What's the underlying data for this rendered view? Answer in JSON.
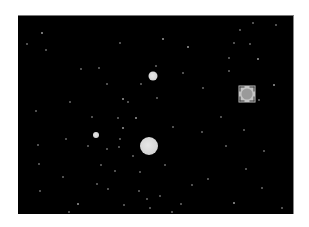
{
  "view": {
    "background": "#000000",
    "page_background": "#ffffff",
    "origin": [
      18,
      15
    ],
    "size": [
      276,
      199
    ]
  },
  "bodies": [
    {
      "name": "large-star",
      "x": 149,
      "y": 145,
      "r": 9
    },
    {
      "name": "medium-star",
      "x": 153,
      "y": 75,
      "r": 4.5
    },
    {
      "name": "small-star",
      "x": 96,
      "y": 134,
      "r": 3
    }
  ],
  "selection": {
    "label": "selected-object",
    "x": 247,
    "y": 93,
    "size": 17,
    "color": "#c4c4c4"
  },
  "stars": [
    [
      42,
      32,
      "dim"
    ],
    [
      27,
      43,
      "faint"
    ],
    [
      46,
      49,
      "faint"
    ],
    [
      120,
      42,
      "faint"
    ],
    [
      163,
      38,
      "dim"
    ],
    [
      188,
      46,
      "dim"
    ],
    [
      240,
      29,
      "faint"
    ],
    [
      253,
      22,
      "faint"
    ],
    [
      276,
      24,
      "faint"
    ],
    [
      250,
      43,
      "faint"
    ],
    [
      234,
      42,
      "faint"
    ],
    [
      229,
      57,
      "faint"
    ],
    [
      258,
      58,
      "dim"
    ],
    [
      81,
      68,
      "faint"
    ],
    [
      99,
      67,
      "faint"
    ],
    [
      156,
      65,
      "faint"
    ],
    [
      183,
      72,
      "faint"
    ],
    [
      203,
      87,
      "faint"
    ],
    [
      229,
      70,
      "faint"
    ],
    [
      274,
      84,
      "dim"
    ],
    [
      259,
      99,
      "faint"
    ],
    [
      107,
      83,
      "faint"
    ],
    [
      141,
      83,
      "faint"
    ],
    [
      123,
      98,
      "dim"
    ],
    [
      128,
      101,
      "faint"
    ],
    [
      70,
      101,
      "faint"
    ],
    [
      36,
      110,
      "faint"
    ],
    [
      157,
      97,
      "faint"
    ],
    [
      92,
      116,
      "faint"
    ],
    [
      136,
      117,
      "dim"
    ],
    [
      118,
      117,
      "faint"
    ],
    [
      123,
      127,
      "dim"
    ],
    [
      173,
      126,
      "faint"
    ],
    [
      221,
      116,
      "faint"
    ],
    [
      202,
      131,
      "faint"
    ],
    [
      244,
      129,
      "faint"
    ],
    [
      66,
      138,
      "faint"
    ],
    [
      120,
      138,
      "faint"
    ],
    [
      107,
      148,
      "faint"
    ],
    [
      119,
      146,
      "faint"
    ],
    [
      88,
      145,
      "faint"
    ],
    [
      38,
      144,
      "faint"
    ],
    [
      165,
      164,
      "faint"
    ],
    [
      101,
      164,
      "faint"
    ],
    [
      133,
      155,
      "faint"
    ],
    [
      226,
      145,
      "faint"
    ],
    [
      264,
      150,
      "faint"
    ],
    [
      39,
      163,
      "faint"
    ],
    [
      63,
      176,
      "faint"
    ],
    [
      115,
      170,
      "faint"
    ],
    [
      140,
      171,
      "faint"
    ],
    [
      246,
      168,
      "faint"
    ],
    [
      97,
      183,
      "faint"
    ],
    [
      108,
      188,
      "faint"
    ],
    [
      139,
      190,
      "faint"
    ],
    [
      40,
      190,
      "faint"
    ],
    [
      78,
      203,
      "dim"
    ],
    [
      124,
      204,
      "faint"
    ],
    [
      147,
      198,
      "faint"
    ],
    [
      150,
      207,
      "faint"
    ],
    [
      160,
      195,
      "faint"
    ],
    [
      172,
      211,
      "faint"
    ],
    [
      181,
      203,
      "faint"
    ],
    [
      234,
      202,
      "dim"
    ],
    [
      282,
      207,
      "faint"
    ],
    [
      69,
      211,
      "faint"
    ],
    [
      262,
      187,
      "faint"
    ],
    [
      208,
      178,
      "faint"
    ],
    [
      192,
      184,
      "faint"
    ]
  ]
}
